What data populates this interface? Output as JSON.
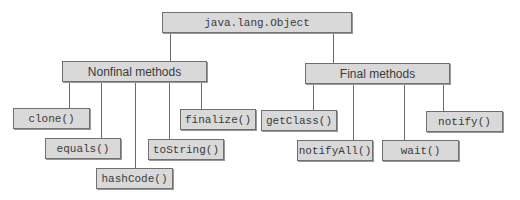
{
  "diagram": {
    "root": {
      "label": "java.lang.Object"
    },
    "groups": [
      {
        "label": "Nonfinal methods",
        "methods": [
          "clone()",
          "equals()",
          "hashCode()",
          "toString()",
          "finalize()"
        ]
      },
      {
        "label": "Final methods",
        "methods": [
          "getClass()",
          "notifyAll()",
          "wait()",
          "notify()"
        ]
      }
    ],
    "colors": {
      "box_fill": "#d9d9d9",
      "box_border": "#707070",
      "line": "#6a6a6a",
      "text": "#3a3a3a"
    }
  }
}
